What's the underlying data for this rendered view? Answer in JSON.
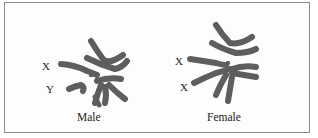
{
  "figure": {
    "panels": [
      {
        "id": "male",
        "caption": "Male",
        "chromosome_labels": [
          "X",
          "Y"
        ]
      },
      {
        "id": "female",
        "caption": "Female",
        "chromosome_labels": [
          "X",
          "X"
        ]
      }
    ],
    "colors": {
      "chromosome": "#5e5e5e",
      "border": "#8a8a8a",
      "text": "#222222"
    }
  }
}
